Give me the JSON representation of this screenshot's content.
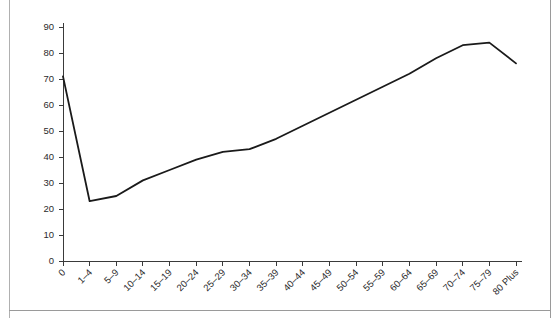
{
  "chart_data": {
    "type": "line",
    "title": "",
    "subtitle": "",
    "xlabel": "",
    "ylabel": "",
    "categories": [
      "0",
      "1–4",
      "5–9",
      "10–14",
      "15–19",
      "20–24",
      "25–29",
      "30–34",
      "35–39",
      "40–44",
      "45–49",
      "50–54",
      "55–59",
      "60–64",
      "65–69",
      "70–74",
      "75–79",
      "80 Plus"
    ],
    "values": [
      71,
      23,
      25,
      31,
      35,
      39,
      42,
      43,
      47,
      52,
      57,
      62,
      67,
      72,
      78,
      83,
      84,
      76
    ],
    "ylim": [
      0,
      90
    ],
    "ytick_labels": [
      "0",
      "10",
      "20",
      "30",
      "40",
      "50",
      "60",
      "70",
      "80",
      "90"
    ],
    "ytick_values": [
      0,
      10,
      20,
      30,
      40,
      50,
      60,
      70,
      80,
      90
    ],
    "grid": false,
    "legend": false,
    "legend_position": "none",
    "series_color": "#1a1a1a",
    "axis_color": "#3a3a3a",
    "background_color": "#ffffff"
  }
}
